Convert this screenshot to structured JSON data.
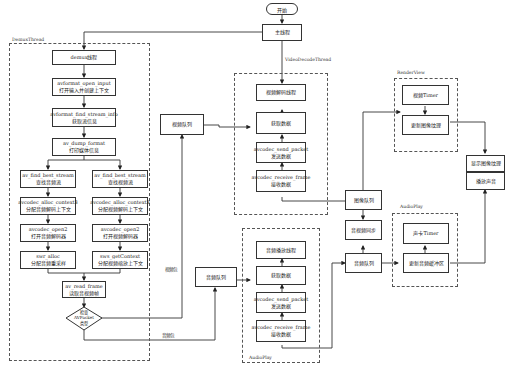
{
  "start": "开始",
  "main_thread": "主线程",
  "groups": {
    "demux": "DemuxThread",
    "video_decode": "VideoDecodeThread",
    "audio_play_decode": "AudioPlay",
    "render_view": "RenderView",
    "audio_play_out": "AudioPlay"
  },
  "demux": {
    "title": "demux线程",
    "open_input": {
      "fn": "avformat_open_input",
      "desc": "打开输入并创建上下文"
    },
    "find_stream_info": {
      "fn": "avformat_find_stream_info",
      "desc": "获取流信息"
    },
    "dump_format": {
      "fn": "av_dump_format",
      "desc": "打印媒体信息"
    },
    "audio": {
      "find_best": {
        "fn": "av_find_best_stream",
        "desc": "查找音频流"
      },
      "alloc_ctx": {
        "fn": "avcodec_alloc_context3",
        "desc": "分配音频解码上下文"
      },
      "open2": {
        "fn": "avcodec_open2",
        "desc": "打开音频解码器"
      },
      "swr": {
        "fn": "swr_alloc",
        "desc": "分配音频重采样"
      }
    },
    "video": {
      "find_best": {
        "fn": "av_find_best_stream",
        "desc": "查找视频流"
      },
      "alloc_ctx": {
        "fn": "avcodec_alloc_context3",
        "desc": "分配视频解码上下文"
      },
      "open2": {
        "fn": "avcodec_open2",
        "desc": "打开视频解码器"
      },
      "sws": {
        "fn": "sws_getContext",
        "desc": "分配视频缩放上下文"
      }
    },
    "read_frame": {
      "fn": "av_read_frame",
      "desc": "读取音视频帧"
    },
    "decision": {
      "line1": "检查",
      "line2": "AVPacket",
      "line3": "类型"
    }
  },
  "queues": {
    "video_packet_queue": "视频队列",
    "audio_packet_queue": "音频队列",
    "image_queue": "图像队列",
    "av_sync": "音视频同步",
    "audio_frame_queue": "音频队列"
  },
  "edge_labels": {
    "video_packet": "视频包",
    "audio_packet": "音频包"
  },
  "video_decode": {
    "title": "视频解码线程",
    "get_data": "获取数据",
    "send_packet": {
      "fn": "avcodec_send_packet",
      "desc": "发送数据"
    },
    "receive_frame": {
      "fn": "avcodec_receive_frame",
      "desc": "接收数据"
    }
  },
  "audio_decode": {
    "title": "音频播放线程",
    "get_data": "获取数据",
    "send_packet": {
      "fn": "avcodec_send_packet",
      "desc": "发送数据"
    },
    "receive_frame": {
      "fn": "avcodec_receive_frame",
      "desc": "接收数据"
    }
  },
  "render": {
    "timer": "视频Timer",
    "update_texture": "更新图像纹理",
    "display": "显示图像纹理"
  },
  "audio_out": {
    "timer": "声卡Timer",
    "update_buffer": "更新音频缓冲区",
    "play": "播放声音"
  }
}
